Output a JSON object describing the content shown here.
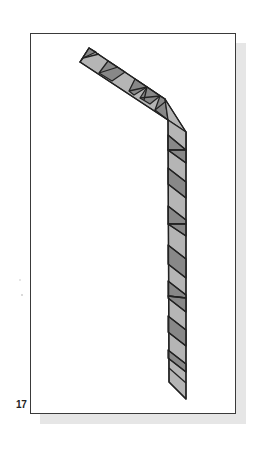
{
  "figure": {
    "number_label": "17",
    "colors": {
      "light_stripe": "#b5b5b5",
      "dark_stripe": "#888888",
      "outline": "#222222",
      "frame_border": "#3a3a3a",
      "shadow": "#e6e6e6"
    }
  }
}
